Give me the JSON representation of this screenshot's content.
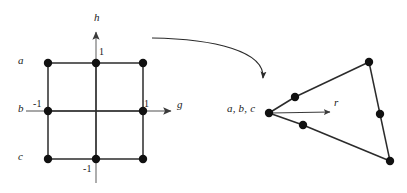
{
  "figure": {
    "caption_present": false,
    "background_color": "#ffffff",
    "stroke_color": "#2b2b2b",
    "node_color": "#111111",
    "arrow_color": "#555555"
  },
  "left_diagram": {
    "name": "parent-element-gh-plane",
    "axes": [
      {
        "id": "h",
        "label": "h",
        "orientation": "vertical",
        "label_x": 94,
        "label_y": 12
      },
      {
        "id": "g",
        "label": "g",
        "orientation": "horizontal",
        "label_x": 177,
        "label_y": 99
      }
    ],
    "tick_labels": [
      {
        "id": "h-plus-1",
        "text": "1",
        "x": 99,
        "y": 47
      },
      {
        "id": "g-minus-1",
        "text": "-1",
        "x": 33,
        "y": 99
      },
      {
        "id": "g-plus-1",
        "text": "1",
        "x": 144,
        "y": 99
      },
      {
        "id": "h-minus-1",
        "text": "-1",
        "x": 83,
        "y": 164
      }
    ],
    "row_labels": [
      {
        "id": "row-a",
        "text": "a",
        "x": 18,
        "y": 55
      },
      {
        "id": "row-b",
        "text": "b",
        "x": 18,
        "y": 103
      },
      {
        "id": "row-c",
        "text": "c",
        "x": 18,
        "y": 151
      }
    ],
    "nodes": [
      {
        "id": "n-a-left",
        "x": 48,
        "y": 63
      },
      {
        "id": "n-a-mid",
        "x": 96,
        "y": 63
      },
      {
        "id": "n-a-right",
        "x": 143,
        "y": 63
      },
      {
        "id": "n-b-left",
        "x": 48,
        "y": 111
      },
      {
        "id": "n-b-right",
        "x": 143,
        "y": 111
      },
      {
        "id": "n-c-left",
        "x": 48,
        "y": 159
      },
      {
        "id": "n-c-mid",
        "x": 96,
        "y": 159
      },
      {
        "id": "n-c-right",
        "x": 143,
        "y": 159
      }
    ]
  },
  "right_diagram": {
    "name": "mapped-element-r-space",
    "origin_label": {
      "id": "abc-label",
      "text": "a, b, c",
      "x": 227,
      "y": 103
    },
    "axis_label": {
      "id": "r-label",
      "text": "r",
      "x": 334,
      "y": 97
    },
    "nodes": [
      {
        "id": "m-apex",
        "x": 269,
        "y": 113
      },
      {
        "id": "m-upper-mid",
        "x": 295,
        "y": 97
      },
      {
        "id": "m-lower-mid",
        "x": 303,
        "y": 125
      },
      {
        "id": "m-top-right",
        "x": 369,
        "y": 62
      },
      {
        "id": "m-right-mid",
        "x": 380,
        "y": 114
      },
      {
        "id": "m-bottom-right",
        "x": 390,
        "y": 161
      }
    ]
  },
  "mapping_arrow": {
    "id": "transform-arrow",
    "start_x": 152,
    "start_y": 38,
    "end_x": 263,
    "end_y": 78
  }
}
